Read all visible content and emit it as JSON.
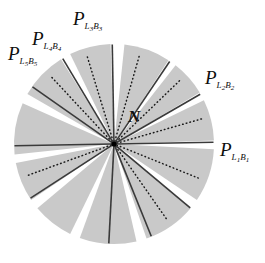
{
  "figure": {
    "background_color": "#ffffff",
    "sector_fill_color": "#c9c9c9",
    "gap_color": "#ffffff",
    "solid_ray_color": "#3a3a3a",
    "dotted_ray_color": "#1a1a1a",
    "node_color": "#000000",
    "center": {
      "x": 114,
      "y": 144
    },
    "radius": 100
  },
  "center_node": {
    "label": "N",
    "name": "node-n",
    "x": 128,
    "y": 108
  },
  "port_labels": [
    {
      "id": "p-l5b5",
      "base": "P",
      "sub_l": "L",
      "sub_l_num": "5",
      "sub_b": "B",
      "sub_b_num": "5",
      "text": "P L5B5",
      "x": 8,
      "y": 44
    },
    {
      "id": "p-l4b4",
      "base": "P",
      "sub_l": "L",
      "sub_l_num": "4",
      "sub_b": "B",
      "sub_b_num": "4",
      "text": "P L4B4",
      "x": 32,
      "y": 29
    },
    {
      "id": "p-l3b3",
      "base": "P",
      "sub_l": "L",
      "sub_l_num": "3",
      "sub_b": "B",
      "sub_b_num": "3",
      "text": "P L3B3",
      "x": 73,
      "y": 9
    },
    {
      "id": "p-l2b2",
      "base": "P",
      "sub_l": "L",
      "sub_l_num": "2",
      "sub_b": "B",
      "sub_b_num": "2",
      "text": "P L2B2",
      "x": 205,
      "y": 68
    },
    {
      "id": "p-l1b1",
      "base": "P",
      "sub_l": "L",
      "sub_l_num": "1",
      "sub_b": "B",
      "sub_b_num": "1",
      "text": "P L1B1",
      "x": 220,
      "y": 140
    }
  ],
  "chart_data": {
    "type": "pie",
    "center": {
      "x": 114,
      "y": 144
    },
    "radius": 100,
    "angle_convention": "degrees, 0 = east (right), measured counter-clockwise",
    "sectors": [
      {
        "name": "sector-1",
        "start_deg": 2,
        "end_deg": 26,
        "fill": "#c9c9c9"
      },
      {
        "name": "sector-2",
        "start_deg": 31,
        "end_deg": 52,
        "fill": "#c9c9c9"
      },
      {
        "name": "sector-3",
        "start_deg": 57,
        "end_deg": 84,
        "fill": "#c9c9c9"
      },
      {
        "name": "sector-4",
        "start_deg": 92,
        "end_deg": 116,
        "fill": "#c9c9c9"
      },
      {
        "name": "sector-5",
        "start_deg": 122,
        "end_deg": 150,
        "fill": "#c9c9c9"
      },
      {
        "name": "sector-6",
        "start_deg": 156,
        "end_deg": 186,
        "fill": "#c9c9c9"
      },
      {
        "name": "sector-7",
        "start_deg": 191,
        "end_deg": 214,
        "fill": "#c9c9c9"
      },
      {
        "name": "sector-8",
        "start_deg": 220,
        "end_deg": 244,
        "fill": "#c9c9c9"
      },
      {
        "name": "sector-9",
        "start_deg": 250,
        "end_deg": 283,
        "fill": "#c9c9c9"
      },
      {
        "name": "sector-10",
        "start_deg": 289,
        "end_deg": 320,
        "fill": "#c9c9c9"
      },
      {
        "name": "sector-11",
        "start_deg": 326,
        "end_deg": 357,
        "fill": "#c9c9c9"
      }
    ],
    "solid_rays": [
      {
        "name": "ray-l1b1",
        "angle_deg": 1,
        "label_id": "p-l1b1"
      },
      {
        "name": "ray-l2b2",
        "angle_deg": 30,
        "label_id": "p-l2b2"
      },
      {
        "name": "ray-b",
        "angle_deg": 56,
        "label_id": null
      },
      {
        "name": "ray-l3b3",
        "angle_deg": 91,
        "label_id": "p-l3b3"
      },
      {
        "name": "ray-l4b4",
        "angle_deg": 121,
        "label_id": "p-l4b4"
      },
      {
        "name": "ray-l5b5",
        "angle_deg": 145,
        "label_id": "p-l5b5"
      },
      {
        "name": "ray-w",
        "angle_deg": 181,
        "label_id": null
      },
      {
        "name": "ray-x",
        "angle_deg": 213,
        "label_id": null
      },
      {
        "name": "ray-y",
        "angle_deg": 267,
        "label_id": null
      },
      {
        "name": "ray-z",
        "angle_deg": 292,
        "label_id": null
      },
      {
        "name": "ray-q",
        "angle_deg": 320,
        "label_id": null
      }
    ],
    "dotted_rays": [
      {
        "name": "dotted-ray-1",
        "angle_deg": 16
      },
      {
        "name": "dotted-ray-2",
        "angle_deg": 44
      },
      {
        "name": "dotted-ray-3",
        "angle_deg": 74
      },
      {
        "name": "dotted-ray-4",
        "angle_deg": 107
      },
      {
        "name": "dotted-ray-5",
        "angle_deg": 133
      },
      {
        "name": "dotted-ray-6",
        "angle_deg": 200
      },
      {
        "name": "dotted-ray-7",
        "angle_deg": 305
      },
      {
        "name": "dotted-ray-8",
        "angle_deg": 338
      }
    ]
  }
}
